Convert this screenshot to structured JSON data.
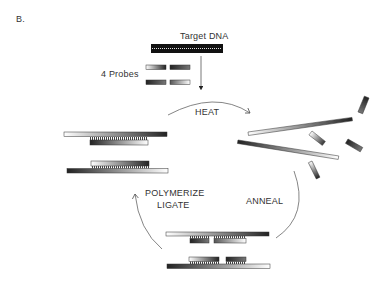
{
  "figure": {
    "panel_label": "B.",
    "labels": {
      "target": "Target DNA",
      "probes": "4 Probes",
      "heat": "HEAT",
      "anneal": "ANNEAL",
      "polymerize": "POLYMERIZE",
      "ligate": "LIGATE"
    },
    "colors": {
      "dark": "#1a1a1a",
      "mid": "#555555",
      "light": "#ffffff",
      "line": "#666666"
    }
  }
}
